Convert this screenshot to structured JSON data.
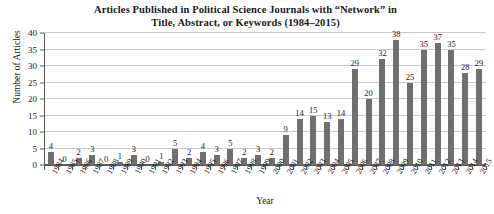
{
  "chart_data": {
    "type": "bar",
    "title": "Articles Published in Political Science Journals with “Network” in Title, Abstract, or Keywords (1984–2015)",
    "title_lines": [
      "Articles Published in Political Science Journals with “Network” in",
      "Title, Abstract, or Keywords (1984–2015)"
    ],
    "xlabel": "Year",
    "ylabel": "Number of Articles",
    "ylim": [
      0,
      40
    ],
    "ytick_values": [
      0,
      5,
      10,
      15,
      20,
      25,
      30,
      35,
      40
    ],
    "ytick_labels": [
      "0",
      "5",
      "10",
      "15",
      "20",
      "25",
      "30",
      "35",
      "40"
    ],
    "grid": true,
    "grid_axis": "y",
    "legend": false,
    "bar_color": "#6f6f6f",
    "show_value_labels": true,
    "categories": [
      "1984",
      "1985",
      "1986",
      "1987",
      "1988",
      "1989",
      "1990",
      "1991",
      "1992",
      "1993",
      "1994",
      "1995",
      "1996",
      "1997",
      "1998",
      "1999",
      "2000",
      "2001",
      "2002",
      "2003",
      "2004",
      "2005",
      "2006",
      "2007",
      "2008",
      "2009",
      "2010",
      "2011",
      "2012",
      "2013",
      "2014",
      "2015"
    ],
    "values": [
      4,
      0,
      2,
      3,
      0,
      1,
      3,
      0,
      1,
      5,
      2,
      4,
      3,
      5,
      2,
      3,
      2,
      9,
      14,
      15,
      13,
      14,
      29,
      20,
      32,
      38,
      25,
      35,
      37,
      35,
      28,
      29
    ]
  }
}
